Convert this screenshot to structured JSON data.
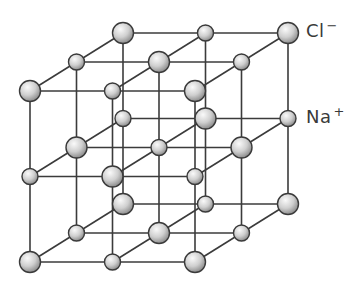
{
  "diagram": {
    "grid_size": 3,
    "origin": {
      "x": 30,
      "y": 91
    },
    "step_x": 82.5,
    "step_y": 85.5,
    "depth_dx": 46.5,
    "depth_dy": -29,
    "ion_at_origin": "Cl",
    "ions": {
      "Cl": {
        "radius": 10.5,
        "symbol": "Cl",
        "charge": "−"
      },
      "Na": {
        "radius": 8,
        "symbol": "Na",
        "charge": "+"
      }
    },
    "colors": {
      "line": "#3b3b3b",
      "ball_light": "#fafafa",
      "ball_mid": "#c9c9c9",
      "ball_dark": "#8a8a8a",
      "ball_stroke": "#3a3a3a"
    }
  },
  "labels": {
    "cl": {
      "symbol": "Cl",
      "charge": "−"
    },
    "na": {
      "symbol": "Na",
      "charge": "+"
    }
  }
}
